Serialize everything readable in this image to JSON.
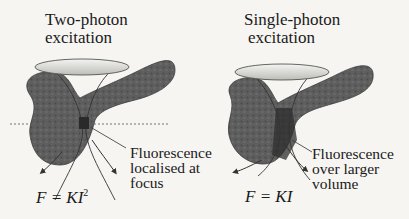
{
  "panels": [
    {
      "id": "two-photon",
      "title_line1": "Two-photon",
      "title_line2": "excitation",
      "annotation_line1": "Fluorescence",
      "annotation_line2": "localised at",
      "annotation_line3": "focus",
      "equation_lhs": "F = KI",
      "equation_exp": "2"
    },
    {
      "id": "single-photon",
      "title_line1": "Single-photon",
      "title_line2": "excitation",
      "annotation_line1": "Fluorescence",
      "annotation_line2": "over larger",
      "annotation_line3": "volume",
      "equation_lhs": "F = KI",
      "equation_exp": ""
    }
  ],
  "colors": {
    "tissue": "#5c5c5c",
    "tissue_dark": "#3a3a3a",
    "lens": "#d8d8d4",
    "background": "#f6f5f2"
  }
}
